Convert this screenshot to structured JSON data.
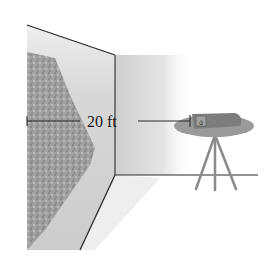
{
  "figure": {
    "dimension_label": "20 ft",
    "colors": {
      "line": "#2a2a2a",
      "wall_shade": "#d6d6d6",
      "image_dark": "#8e8e8e",
      "image_mid": "#a8a8a8",
      "table": "#9a9a9a",
      "projector": "#7d7d7d",
      "tripod": "#8a8a8a"
    }
  }
}
